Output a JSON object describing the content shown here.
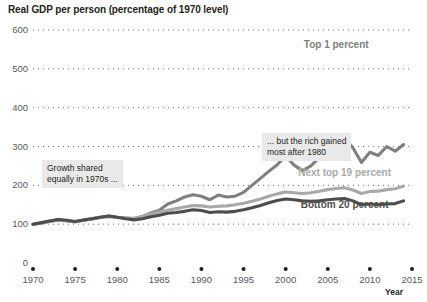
{
  "chart_data": {
    "type": "line",
    "title": "Real GDP per person (percentage of 1970 level)",
    "xlabel": "Year",
    "ylabel": "",
    "xlim": [
      1970,
      2015
    ],
    "ylim": [
      0,
      600
    ],
    "grid": true,
    "grid_style": "dotted-horizontal",
    "legend": "inline-labels",
    "yticks": [
      "0",
      "100",
      "200",
      "300",
      "400",
      "500",
      "600"
    ],
    "ytick_values": [
      0,
      100,
      200,
      300,
      400,
      500,
      600
    ],
    "xticks": [
      "1970",
      "1975",
      "1980",
      "1985",
      "1990",
      "1995",
      "2000",
      "2005",
      "2010",
      "2015"
    ],
    "xtick_values": [
      1970,
      1975,
      1980,
      1985,
      1990,
      1995,
      2000,
      2005,
      2010,
      2015
    ],
    "x": [
      1970,
      1971,
      1972,
      1973,
      1974,
      1975,
      1976,
      1977,
      1978,
      1979,
      1980,
      1981,
      1982,
      1983,
      1984,
      1985,
      1986,
      1987,
      1988,
      1989,
      1990,
      1991,
      1992,
      1993,
      1994,
      1995,
      1996,
      1997,
      1998,
      1999,
      2000,
      2001,
      2002,
      2003,
      2004,
      2005,
      2006,
      2007,
      2008,
      2009,
      2010,
      2011,
      2012,
      2013,
      2014
    ],
    "series": [
      {
        "name": "Top 1 percent",
        "color": "#808080",
        "label_x": 2006,
        "label_y": 560,
        "values": [
          100,
          103,
          108,
          112,
          109,
          106,
          110,
          114,
          118,
          121,
          118,
          116,
          114,
          120,
          129,
          136,
          152,
          160,
          170,
          176,
          172,
          163,
          175,
          170,
          172,
          182,
          200,
          218,
          236,
          253,
          276,
          252,
          238,
          250,
          272,
          300,
          318,
          322,
          296,
          259,
          285,
          277,
          300,
          288,
          305
        ]
      },
      {
        "name": "Next top 19 percent",
        "color": "#a9a9a9",
        "label_x": 2007,
        "label_y": 228,
        "values": [
          100,
          103,
          107,
          110,
          108,
          106,
          110,
          113,
          117,
          119,
          117,
          116,
          115,
          120,
          126,
          131,
          136,
          140,
          144,
          148,
          147,
          144,
          146,
          147,
          150,
          154,
          159,
          165,
          172,
          178,
          183,
          181,
          179,
          181,
          185,
          189,
          192,
          194,
          188,
          179,
          184,
          185,
          189,
          191,
          198
        ]
      },
      {
        "name": "Bottom 20 percent",
        "color": "#4d4d4d",
        "label_x": 2007,
        "label_y": 148,
        "values": [
          100,
          104,
          108,
          112,
          110,
          107,
          111,
          114,
          118,
          121,
          118,
          114,
          111,
          114,
          119,
          123,
          128,
          130,
          133,
          137,
          135,
          130,
          132,
          131,
          133,
          137,
          142,
          148,
          155,
          161,
          165,
          163,
          160,
          159,
          160,
          163,
          165,
          166,
          160,
          150,
          152,
          150,
          152,
          153,
          160
        ]
      }
    ],
    "annotations": [
      {
        "id": "annot-1970s",
        "lines": [
          "Growth shared",
          "equally in 1970s ..."
        ],
        "x_px": 42,
        "y_px": 160
      },
      {
        "id": "annot-after-1980",
        "lines": [
          "... but the rich gained",
          "most after 1980"
        ],
        "x_px": 262,
        "y_px": 133
      }
    ]
  }
}
